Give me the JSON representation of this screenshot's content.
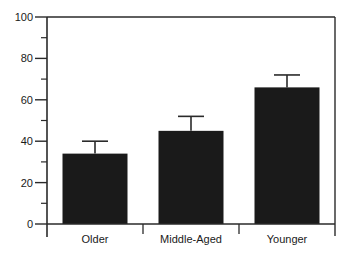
{
  "chart_data": {
    "type": "bar",
    "title": "",
    "xlabel": "",
    "ylabel": "",
    "categories": [
      "Older",
      "Middle-Aged",
      "Younger"
    ],
    "values": [
      34,
      45,
      66
    ],
    "error_upper": [
      40,
      52,
      72
    ],
    "error_bars": "upper-only",
    "ylim": [
      0,
      100
    ],
    "yticks": [
      0,
      20,
      40,
      60,
      80,
      100
    ],
    "minor_yticks": [
      10,
      30,
      50,
      70,
      90
    ],
    "grid": false,
    "legend": null,
    "bar_color": "#1a1a1a"
  },
  "colors": {
    "bar": "#1a1a1a",
    "axis": "#2a2a2a",
    "background": "#ffffff"
  }
}
